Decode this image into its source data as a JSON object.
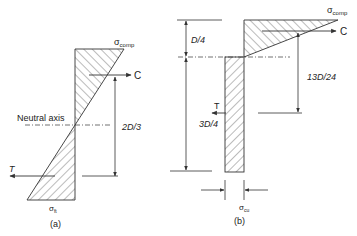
{
  "diagram_a": {
    "caption": "(a)",
    "sigma_top": "σ",
    "sigma_top_sub": "comp",
    "sigma_bottom": "σ",
    "sigma_bottom_sub": "ft",
    "compression_label": "C",
    "tension_label": "T",
    "neutral_axis_label": "Neutral axis",
    "lever_arm_label": "2D/3"
  },
  "diagram_b": {
    "caption": "(b)",
    "sigma_top": "σ",
    "sigma_top_sub": "comp",
    "sigma_bottom": "σ",
    "sigma_bottom_sub": "cu",
    "compression_label": "C",
    "tension_label": "T",
    "top_depth_label": "D/4",
    "bottom_depth_label": "3D/4",
    "lever_arm_label": "13D/24"
  },
  "colors": {
    "line": "#333333",
    "hatch": "#555555",
    "background": "#ffffff"
  }
}
